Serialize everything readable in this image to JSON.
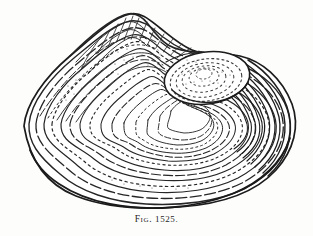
{
  "plate": {
    "background_color": "#fdfdfc",
    "ink_color": "#1f1f1f",
    "width": 313,
    "height": 236
  },
  "caption": {
    "full_text": "FIG. 1525.",
    "prefix": "Fig.",
    "number": "1525.",
    "align": "center"
  },
  "illustration": {
    "subject": "bivalve-shell",
    "description": "Engraved bivalve (clam) shell in oblique view with concentric growth lines",
    "view": "oblique-right-umbo",
    "outline_color": "#1f1f1f",
    "growth_line_color": "#2b2b2b",
    "stipple_color": "#3a3a3a",
    "features": [
      "dorsal-ridge",
      "umbo",
      "concentric-growth-lines",
      "ventral-margin",
      "stippled-shading"
    ],
    "bounds": {
      "left": 22,
      "top": 14,
      "right": 296,
      "bottom": 208
    },
    "umbo": {
      "cx": 207,
      "cy": 78,
      "rx": 43,
      "ry": 26,
      "rotation": -8
    }
  }
}
